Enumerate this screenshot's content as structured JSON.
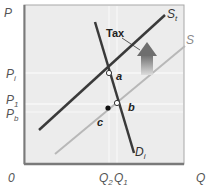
{
  "diagram": {
    "axes": {
      "y_label": "P",
      "x_label": "Q",
      "origin": "0"
    },
    "price_ticks": [
      {
        "main": "P",
        "sub": "i",
        "name": "price-tick-pi"
      },
      {
        "main": "P",
        "sub": "1",
        "name": "price-tick-p1"
      },
      {
        "main": "P",
        "sub": "b",
        "name": "price-tick-pb"
      }
    ],
    "quantity_ticks": [
      {
        "main": "Q",
        "sub": "2",
        "name": "quantity-tick-q2"
      },
      {
        "main": "Q",
        "sub": "1",
        "name": "quantity-tick-q1"
      }
    ],
    "curves": {
      "supply_taxed": {
        "main": "S",
        "sub": "t",
        "color": "#3a3a3a"
      },
      "supply": {
        "main": "S",
        "sub": "",
        "color": "#b8b8b8"
      },
      "demand": {
        "main": "D",
        "sub": "i",
        "color": "#3a3a3a"
      }
    },
    "points": {
      "a": "a",
      "b": "b",
      "c": "c"
    },
    "annotations": {
      "tax": "Tax"
    },
    "colors": {
      "plot_background": "#ececec",
      "axis": "#7a7a7a",
      "gridline": "#f7f7f7",
      "arrow_top": "#6e6e6e",
      "arrow_bottom": "#dcdcdc"
    }
  }
}
